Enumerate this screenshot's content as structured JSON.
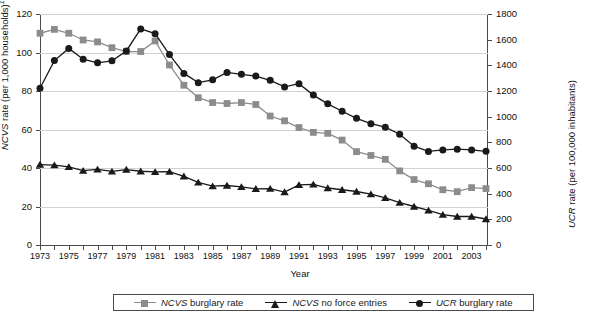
{
  "chart_data": {
    "type": "line",
    "title": "",
    "xlabel": "Year",
    "ylabel": "NCVS rate (per 1,000 households)",
    "ylabel_footnote": "1",
    "ylabel_right": "UCR rate (per 100,000 inhabitants)",
    "x": [
      1973,
      1974,
      1975,
      1976,
      1977,
      1978,
      1979,
      1980,
      1981,
      1982,
      1983,
      1984,
      1985,
      1986,
      1987,
      1988,
      1989,
      1990,
      1991,
      1992,
      1993,
      1994,
      1995,
      1996,
      1997,
      1998,
      1999,
      2000,
      2001,
      2002,
      2003,
      2004
    ],
    "xticklabels": [
      "1973",
      "",
      "1975",
      "",
      "1977",
      "",
      "1979",
      "",
      "1981",
      "",
      "1983",
      "",
      "1985",
      "",
      "1987",
      "",
      "1989",
      "",
      "1991",
      "",
      "1993",
      "",
      "1995",
      "",
      "1997",
      "",
      "1999",
      "",
      "2001",
      "",
      "2003",
      ""
    ],
    "ylim": [
      0,
      120
    ],
    "yticks": [
      0,
      20,
      40,
      60,
      80,
      100,
      120
    ],
    "ylim_right": [
      0,
      1800
    ],
    "yticks_right": [
      0,
      200,
      400,
      600,
      800,
      1000,
      1200,
      1400,
      1600,
      1800
    ],
    "grid": true,
    "legend_position": "bottom",
    "series": [
      {
        "name": "NCVS burglary rate",
        "axis": "left",
        "marker": "square",
        "color": "#8c8c8c",
        "values": [
          110.0,
          112.0,
          110.0,
          106.5,
          105.5,
          102.5,
          100.5,
          100.5,
          106.0,
          93.5,
          83.0,
          76.5,
          74.0,
          73.5,
          74.0,
          73.0,
          67.0,
          64.5,
          61.0,
          58.5,
          58.0,
          54.5,
          48.5,
          46.5,
          44.5,
          38.5,
          34.0,
          31.8,
          28.7,
          27.7,
          29.8,
          29.3
        ]
      },
      {
        "name": "NCVS no force entries",
        "axis": "left",
        "marker": "triangle",
        "color": "#1a1a1a",
        "values": [
          41.8,
          41.5,
          40.6,
          38.6,
          39.3,
          38.2,
          39.2,
          38.3,
          38.0,
          38.1,
          35.7,
          32.5,
          30.6,
          30.9,
          30.2,
          29.2,
          29.3,
          27.5,
          31.2,
          31.5,
          29.6,
          28.7,
          27.8,
          26.4,
          24.5,
          22.0,
          20.0,
          18.0,
          15.8,
          14.8,
          14.8,
          13.5
        ]
      },
      {
        "name": "UCR burglary rate",
        "axis": "right",
        "marker": "circle",
        "color": "#1a1a1a",
        "values": [
          1222,
          1437,
          1532,
          1448,
          1420,
          1435,
          1512,
          1684,
          1647,
          1484,
          1337,
          1265,
          1287,
          1345,
          1330,
          1316,
          1283,
          1232,
          1257,
          1168,
          1100,
          1042,
          987,
          945,
          918,
          863,
          770,
          729,
          741,
          747,
          741,
          730
        ]
      }
    ]
  },
  "legend": {
    "items": [
      {
        "label_em": "NCVS",
        "label_rest": " burglary rate",
        "marker": "square",
        "color": "#8c8c8c"
      },
      {
        "label_em": "NCVS",
        "label_rest": " no force entries",
        "marker": "triangle",
        "color": "#1a1a1a"
      },
      {
        "label_em": "UCR",
        "label_rest": " burglary rate",
        "marker": "circle",
        "color": "#1a1a1a"
      }
    ]
  }
}
